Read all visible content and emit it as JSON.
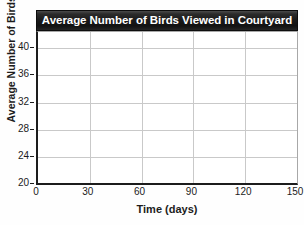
{
  "chart_data": {
    "type": "line",
    "title": "Average Number of Birds Viewed in Courtyard",
    "xlabel": "Time (days)",
    "ylabel": "Average Number of Birds",
    "xlim": [
      0,
      150
    ],
    "ylim": [
      20,
      42.4
    ],
    "x_ticks": [
      0,
      30,
      60,
      90,
      120,
      150
    ],
    "x_tick_labels": [
      "0",
      "30",
      "60",
      "90",
      "120",
      "150"
    ],
    "y_ticks": [
      20,
      24,
      28,
      32,
      36,
      40
    ],
    "y_tick_labels": [
      "20",
      "24",
      "28",
      "32",
      "36",
      "40"
    ],
    "grid": true,
    "legend": false,
    "series": [],
    "values": [],
    "annotations": [],
    "note": "Empty grid — no data plotted"
  },
  "style": {
    "title_background": "#1a1a1a",
    "title_color": "#ffffff",
    "axis_color": "#1c1c1c",
    "gridline_color": "#c9c9c9",
    "plot_background": "#ffffff",
    "page_background": "#fefefe"
  }
}
